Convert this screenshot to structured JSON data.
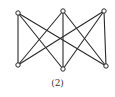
{
  "diagram": {
    "type": "graph",
    "name": "K3,3 complete bipartite graph",
    "caption": "(2)",
    "stroke_color": "#2a2a2a",
    "vertex_fill": "#ffffff",
    "vertices": [
      {
        "id": "TL",
        "x": 18,
        "y": 13
      },
      {
        "id": "TM",
        "x": 63,
        "y": 11
      },
      {
        "id": "TR",
        "x": 104,
        "y": 11
      },
      {
        "id": "BL",
        "x": 18,
        "y": 65
      },
      {
        "id": "BM",
        "x": 63,
        "y": 69
      },
      {
        "id": "BR",
        "x": 106,
        "y": 66
      }
    ],
    "edges": [
      [
        "TL",
        "BL"
      ],
      [
        "TL",
        "BM"
      ],
      [
        "TL",
        "BR"
      ],
      [
        "TM",
        "BL"
      ],
      [
        "TM",
        "BM"
      ],
      [
        "TM",
        "BR"
      ],
      [
        "TR",
        "BL"
      ],
      [
        "TR",
        "BM"
      ],
      [
        "TR",
        "BR"
      ]
    ]
  }
}
